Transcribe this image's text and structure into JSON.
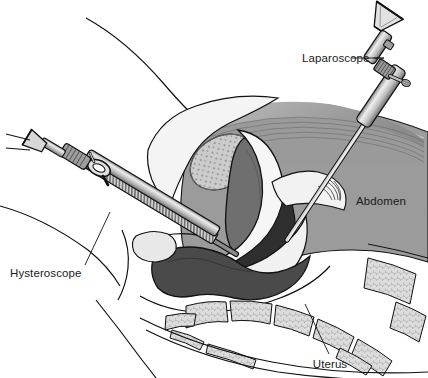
{
  "figure": {
    "background_color": "#ffffff",
    "width": 428,
    "height": 378
  },
  "labels": [
    {
      "id": "laparoscope",
      "text": "Laparoscope",
      "x": 302,
      "y": 62,
      "anchor": "start",
      "leader": {
        "x1": 374,
        "y1": 58,
        "x2": 384,
        "y2": 58
      }
    },
    {
      "id": "abdomen",
      "text": "Abdomen",
      "x": 356,
      "y": 205,
      "anchor": "start",
      "leader": null
    },
    {
      "id": "hysteroscope",
      "text": "Hysteroscope",
      "x": 10,
      "y": 277,
      "anchor": "start",
      "leader": {
        "x1": 85,
        "y1": 265,
        "x2": 110,
        "y2": 212
      }
    },
    {
      "id": "uterus",
      "text": "Uterus",
      "x": 330,
      "y": 368,
      "anchor": "middle",
      "leader": {
        "x1": 329,
        "y1": 354,
        "x2": 305,
        "y2": 304
      }
    }
  ],
  "instruments": [
    {
      "id": "laparoscope-instrument",
      "name": "Laparoscope",
      "description": "Rigid endoscope with funnel eyepiece, knurled collar and side light-post, inserted through the abdominal wall toward the pelvis"
    },
    {
      "id": "hysteroscope-instrument",
      "name": "Hysteroscope",
      "description": "Rigid endoscope with eyepiece, ring handle and ribbed sheath, inserted through the vagina and cervix into the uterine cavity"
    }
  ],
  "anatomy": [
    {
      "id": "body-outline",
      "name": "Body outline",
      "fill": "none"
    },
    {
      "id": "abdominal-cavity",
      "name": "Abdominal cavity",
      "fill": "#9b9b9b"
    },
    {
      "id": "bladder",
      "name": "Bladder",
      "fill": "#c9c9c9",
      "texture": "stipple"
    },
    {
      "id": "uterus-body",
      "name": "Uterus",
      "fill": "#6f6f6f"
    },
    {
      "id": "vagina",
      "name": "Vagina",
      "fill": "#efefef"
    },
    {
      "id": "rectum",
      "name": "Rectum",
      "fill": "#4a4a4a"
    },
    {
      "id": "fallopian-tube",
      "name": "Fallopian tube and fimbriae",
      "fill": "#f2f2f2"
    },
    {
      "id": "sacrum",
      "name": "Sacrum and coccyx vertebrae",
      "fill": "#d8d8d8",
      "texture": "trabecular"
    },
    {
      "id": "pubic-bone",
      "name": "Pubic bone",
      "fill": "#e8e8e8"
    }
  ],
  "colors": {
    "outline": "#111111",
    "abdomen_gray": "#9b9b9b",
    "uterus_dark": "#6f6f6f",
    "rectum_dark": "#4a4a4a",
    "bone_light": "#d8d8d8",
    "tissue_light": "#f1f1f1",
    "metal_light": "#d9d9d9",
    "metal_mid": "#a8a8a8",
    "metal_dark": "#6a6a6a",
    "text": "#1a1a1a"
  }
}
